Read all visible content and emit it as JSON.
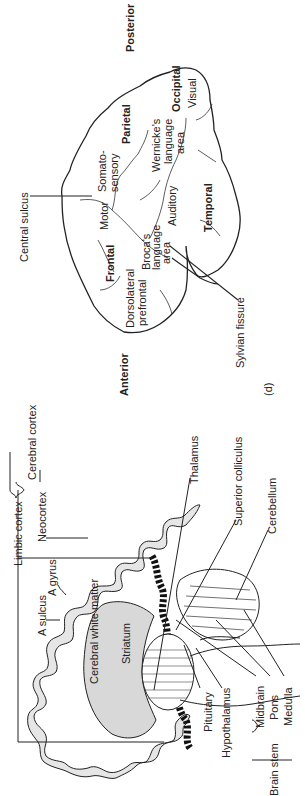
{
  "figure": {
    "panel_label": "(d)",
    "orientation": "rotated 90 degrees counter-clockwise"
  },
  "lateral_view": {
    "directions": {
      "posterior": "Posterior",
      "anterior": "Anterior"
    },
    "lobes": {
      "frontal": "Frontal",
      "parietal": "Parietal",
      "occipital": "Occipital",
      "temporal": "Temporal"
    },
    "areas": {
      "somatosensory_1": "Somato-",
      "somatosensory_2": "sensory",
      "motor": "Motor",
      "visual": "Visual",
      "wernicke_1": "Wernicke's",
      "wernicke_2": "language",
      "wernicke_3": "area",
      "auditory": "Auditory",
      "broca_1": "Broca's",
      "broca_2": "language",
      "broca_3": "area",
      "dlpfc_1": "Dorsolateral",
      "dlpfc_2": "prefrontal"
    },
    "callouts": {
      "central_sulcus": "Central sulcus",
      "sylvian_fissure": "Sylvian fissure"
    }
  },
  "sagittal_view": {
    "labels": {
      "limbic_cortex": "Limbic cortex",
      "neocortex": "Neocortex",
      "cerebral_cortex": "Cerebral cortex",
      "a_gyrus": "A gyrus",
      "a_sulcus": "A sulcus",
      "cerebral_white_matter": "Cerebral white matter",
      "striatum": "Striatum",
      "thalamus": "Thalamus",
      "superior_colliculus": "Superior colliculus",
      "cerebellum": "Cerebellum",
      "pituitary": "Pituitary",
      "hypothalamus": "Hypothalamus",
      "midbrain": "Midbrain",
      "pons": "Pons",
      "medulla": "Medulla",
      "brain_stem": "Brain stem"
    }
  }
}
